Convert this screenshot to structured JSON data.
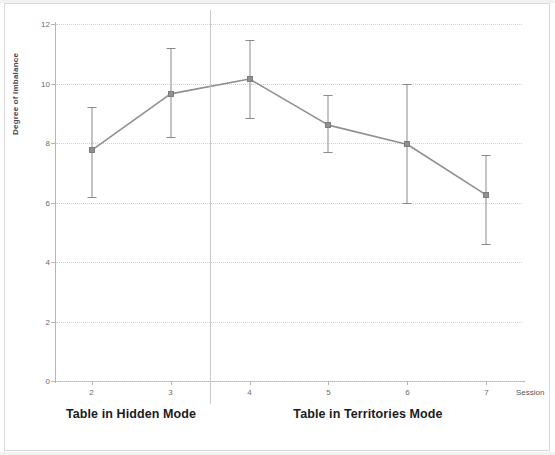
{
  "chart_data": {
    "type": "line",
    "title": "",
    "subtitle": "",
    "xlabel": "Session",
    "ylabel": "Degree of Imbalance",
    "x": [
      2,
      3,
      4,
      5,
      6,
      7
    ],
    "xtick_labels": [
      "2",
      "3",
      "4",
      "5",
      "6",
      "7"
    ],
    "ytick_labels": [
      "0",
      "2",
      "4",
      "6",
      "8",
      "10",
      "12"
    ],
    "ytick_values": [
      0,
      2,
      4,
      6,
      8,
      10,
      12
    ],
    "xlim": [
      1.55,
      7.45
    ],
    "ylim": [
      0,
      12
    ],
    "grid": true,
    "grid_style": "dotted-horizontal",
    "legend": "none",
    "series": [
      {
        "name": "Degree of Imbalance",
        "values": [
          7.75,
          9.65,
          10.15,
          8.6,
          7.95,
          6.25
        ],
        "error_low": [
          6.2,
          8.2,
          8.85,
          7.7,
          6.0,
          4.6
        ],
        "error_high": [
          9.2,
          11.2,
          11.45,
          9.6,
          10.0,
          7.6
        ],
        "marker": "square",
        "color": "#8f8f8f"
      }
    ],
    "annotations": [
      {
        "type": "vline",
        "x": 3.5,
        "label": "condition-divider"
      },
      {
        "type": "band-label",
        "text": "Table in Hidden Mode",
        "x_center": 2.5
      },
      {
        "type": "band-label",
        "text": "Table in Territories Mode",
        "x_center": 5.5
      }
    ]
  },
  "axes": {
    "y_title": "Degree of Imbalance",
    "x_title": "Session"
  },
  "conditions": [
    {
      "label": "Table in Hidden Mode"
    },
    {
      "label": "Table in Territories Mode"
    }
  ],
  "colors": {
    "series": "#8f8f8f",
    "errorbar": "#8a8a8a",
    "grid": "#d2d2cf",
    "axis": "#b6b6b6",
    "divider": "#c9c9c9",
    "text": "#1c1c1c",
    "tick_text": "#6a6a6a"
  }
}
